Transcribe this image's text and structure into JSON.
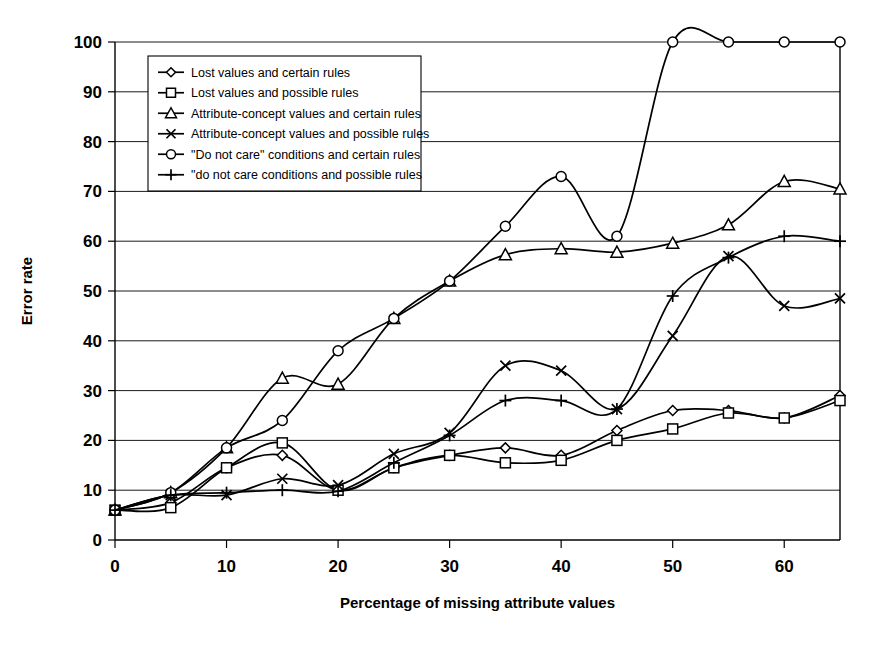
{
  "chart_data": {
    "type": "line",
    "title": "",
    "xlabel": "Percentage of missing attribute values",
    "ylabel": "Error rate",
    "xlim": [
      0,
      65
    ],
    "ylim": [
      0,
      100
    ],
    "xticks": [
      0,
      10,
      20,
      30,
      40,
      50,
      60
    ],
    "yticks": [
      0,
      10,
      20,
      30,
      40,
      50,
      60,
      70,
      80,
      90,
      100
    ],
    "grid": "horizontal",
    "legend_position": "upper-left-inside",
    "x": [
      0,
      5,
      10,
      15,
      20,
      25,
      30,
      35,
      40,
      45,
      50,
      55,
      60,
      65
    ],
    "series": [
      {
        "name": "Lost values and certain rules",
        "marker": "diamond",
        "values": [
          6,
          7.5,
          14.5,
          17,
          10,
          14.5,
          17,
          18.5,
          17,
          22,
          26,
          26,
          24.5,
          29
        ]
      },
      {
        "name": "Lost values and possible rules",
        "marker": "square",
        "values": [
          6,
          6.5,
          14.5,
          19.5,
          10,
          14.5,
          17,
          15.5,
          16,
          20,
          22.3,
          25.5,
          24.5,
          28
        ]
      },
      {
        "name": "Attribute-concept values and certain rules",
        "marker": "triangle",
        "values": [
          6,
          9.5,
          18.5,
          32.5,
          31.3,
          44.5,
          52,
          57.3,
          58.5,
          57.8,
          59.6,
          63.3,
          72,
          70.5
        ]
      },
      {
        "name": "Attribute-concept values and possible rules",
        "marker": "cross",
        "values": [
          6,
          9,
          9,
          12.3,
          11,
          17.3,
          21.5,
          35,
          34,
          26.3,
          41,
          57,
          47,
          48.5
        ]
      },
      {
        "name": "\"Do not care\" conditions and certain rules",
        "marker": "circle",
        "values": [
          6,
          9.5,
          18.5,
          24,
          38,
          44.5,
          52,
          63,
          73,
          61,
          100,
          100,
          100,
          100
        ]
      },
      {
        "name": "\"do not care conditions and possible rules",
        "marker": "plus",
        "values": [
          6,
          9,
          9.5,
          10,
          9.8,
          15.5,
          21,
          28,
          28,
          26.3,
          49,
          56.7,
          61,
          60
        ]
      }
    ]
  },
  "legend": {
    "items": [
      {
        "label": "Lost values and certain rules",
        "marker": "diamond"
      },
      {
        "label": "Lost values and possible rules",
        "marker": "square"
      },
      {
        "label": "Attribute-concept values and certain rules",
        "marker": "triangle"
      },
      {
        "label": "Attribute-concept values and possible rules",
        "marker": "cross"
      },
      {
        "label": "\"Do not care\" conditions and certain rules",
        "marker": "circle"
      },
      {
        "label": "\"do not care conditions and possible rules",
        "marker": "plus"
      }
    ]
  },
  "colors": {
    "line": "#000000",
    "grid": "#000000",
    "background": "#ffffff"
  }
}
